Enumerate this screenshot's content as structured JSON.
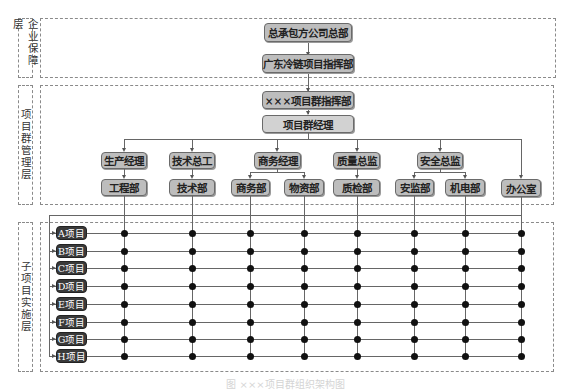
{
  "layers": [
    {
      "id": "enterprise",
      "label": "企业保障层"
    },
    {
      "id": "group-management",
      "label": "项目群管理层"
    },
    {
      "id": "sub-project",
      "label": "子项目实施层"
    }
  ],
  "nodes": {
    "hq": "总承包方公司总部",
    "gd_command": "广东冷链项目指挥部",
    "xxx_command": "×××项目群指挥部",
    "group_manager": "项目群经理",
    "managers": [
      {
        "label": "生产经理",
        "departments": [
          "工程部"
        ]
      },
      {
        "label": "技术总工",
        "departments": [
          "技术部"
        ]
      },
      {
        "label": "商务经理",
        "departments": [
          "商务部",
          "物资部"
        ]
      },
      {
        "label": "质量总监",
        "departments": [
          "质检部"
        ]
      },
      {
        "label": "安全总监",
        "departments": [
          "安监部",
          "机电部"
        ]
      }
    ],
    "office": "办公室"
  },
  "projects": [
    "A项目",
    "B项目",
    "C项目",
    "D项目",
    "E项目",
    "F项目",
    "G项目",
    "H项目"
  ],
  "department_columns": [
    "工程部",
    "技术部",
    "商务部",
    "物资部",
    "质检部",
    "安监部",
    "机电部",
    "办公室"
  ],
  "caption": "图  ×××项目群组织架构图",
  "colors": {
    "node_fill": "#bdbdbd",
    "node_fill_light": "#d2d2d2",
    "project_fill": "#3a3a3a",
    "dashed_border": "#8a8a8a",
    "dot": "#111111"
  }
}
